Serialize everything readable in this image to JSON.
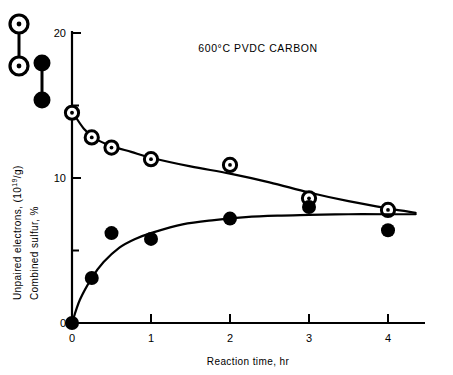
{
  "chart_data": {
    "type": "scatter",
    "title": "600°C PVDC CARBON",
    "xlabel": "Reaction time, hr",
    "ylabel_line1": "Unpaired electrons, (10",
    "ylabel_line1_sup": "19",
    "ylabel_line1_tail": "/g)",
    "ylabel_line2": "Combined sulfur, %",
    "xlim": [
      0,
      4.45
    ],
    "ylim": [
      0,
      21
    ],
    "xticks": [
      0,
      1,
      2,
      3,
      4
    ],
    "xtick_labels": [
      "0",
      "1",
      "2",
      "3",
      "4"
    ],
    "yticks": [
      0,
      10,
      20
    ],
    "ytick_labels": [
      "0",
      "10",
      "20"
    ],
    "yticks_minor": [
      5,
      15
    ],
    "grid": false,
    "legend_position": "upper-left-outside",
    "series": [
      {
        "name": "Unpaired electrons",
        "marker": "open-circle-dot",
        "x": [
          0,
          0.25,
          0.5,
          1,
          2,
          3,
          4
        ],
        "values": [
          14.5,
          12.8,
          12.1,
          11.3,
          10.9,
          8.6,
          7.8
        ],
        "fit_curve": [
          [
            0,
            14.6
          ],
          [
            0.15,
            13.4
          ],
          [
            0.3,
            12.7
          ],
          [
            0.5,
            12.2
          ],
          [
            0.75,
            11.8
          ],
          [
            1,
            11.4
          ],
          [
            1.5,
            10.8
          ],
          [
            2,
            10.3
          ],
          [
            2.5,
            9.7
          ],
          [
            3,
            9.0
          ],
          [
            3.5,
            8.4
          ],
          [
            4,
            7.9
          ],
          [
            4.35,
            7.6
          ]
        ]
      },
      {
        "name": "Combined sulfur",
        "marker": "filled-circle",
        "x": [
          0,
          0.25,
          0.5,
          1,
          2,
          3,
          4
        ],
        "values": [
          0.0,
          3.1,
          6.2,
          5.8,
          7.2,
          8.0,
          6.4
        ],
        "fit_curve": [
          [
            0,
            0
          ],
          [
            0.1,
            1.6
          ],
          [
            0.25,
            3.1
          ],
          [
            0.4,
            4.2
          ],
          [
            0.6,
            5.2
          ],
          [
            0.8,
            5.8
          ],
          [
            1,
            6.2
          ],
          [
            1.4,
            6.8
          ],
          [
            1.8,
            7.1
          ],
          [
            2.2,
            7.3
          ],
          [
            2.6,
            7.4
          ],
          [
            3,
            7.45
          ],
          [
            3.5,
            7.5
          ],
          [
            4,
            7.5
          ],
          [
            4.35,
            7.5
          ]
        ]
      }
    ]
  },
  "legend": {
    "entry_open": "open-circle-dot-marker",
    "entry_filled": "filled-circle-marker"
  }
}
